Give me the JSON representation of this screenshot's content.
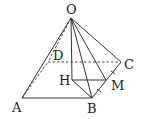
{
  "diagram": {
    "type": "geometry-pyramid",
    "points": {
      "O": {
        "label": "O",
        "x": 71,
        "y": 18
      },
      "A": {
        "label": "A",
        "x": 22,
        "y": 98
      },
      "B": {
        "label": "B",
        "x": 92,
        "y": 98
      },
      "C": {
        "label": "C",
        "x": 121,
        "y": 62
      },
      "D": {
        "label": "D",
        "x": 48,
        "y": 62
      },
      "H": {
        "label": "H",
        "x": 72,
        "y": 80
      },
      "M": {
        "label": "M",
        "x": 106,
        "y": 80
      }
    },
    "solid_edges": [
      "OA",
      "OB",
      "OC",
      "OH",
      "OM",
      "AB",
      "BC",
      "HB",
      "HM"
    ],
    "dashed_edges": [
      "OD",
      "AD",
      "DC"
    ],
    "equal_marks_on": "BC"
  }
}
